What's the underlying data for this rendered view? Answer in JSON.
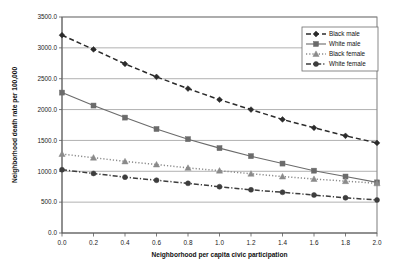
{
  "chart_data": {
    "type": "line",
    "title": "",
    "xlabel": "Neighborhood per capita civic participation",
    "ylabel": "Neighborhood death rate per 100,000",
    "x": [
      0.0,
      0.2,
      0.4,
      0.6,
      0.8,
      1.0,
      1.2,
      1.4,
      1.6,
      1.8,
      2.0
    ],
    "xlim": [
      0.0,
      2.0
    ],
    "ylim": [
      0.0,
      3500.0
    ],
    "xticks": [
      "0.0",
      "0.2",
      "0.4",
      "0.6",
      "0.8",
      "1.0",
      "1.2",
      "1.4",
      "1.6",
      "1.8",
      "2.0"
    ],
    "yticks": [
      "0.0",
      "500.0",
      "1000.0",
      "1500.0",
      "2000.0",
      "2500.0",
      "3000.0",
      "3500.0"
    ],
    "grid": "horizontal",
    "legend_position": "top-right",
    "series": [
      {
        "name": "Black male",
        "marker": "diamond",
        "line_style": "dashed",
        "color": "#2b2b2b",
        "values": [
          3205,
          2975,
          2740,
          2530,
          2340,
          2160,
          2000,
          1840,
          1705,
          1575,
          1460
        ]
      },
      {
        "name": "White male",
        "marker": "square",
        "line_style": "solid",
        "color": "#6b6b6b",
        "values": [
          2275,
          2065,
          1870,
          1685,
          1520,
          1375,
          1245,
          1125,
          1010,
          915,
          820
        ]
      },
      {
        "name": "Black female",
        "marker": "triangle",
        "line_style": "dotted",
        "color": "#8a8a8a",
        "values": [
          1280,
          1220,
          1160,
          1110,
          1055,
          1010,
          960,
          915,
          875,
          840,
          805
        ]
      },
      {
        "name": "White female",
        "marker": "circle",
        "line_style": "dashdot",
        "color": "#3d3d3d",
        "values": [
          1025,
          965,
          905,
          855,
          805,
          750,
          700,
          660,
          615,
          570,
          535
        ]
      }
    ]
  },
  "legend": {
    "items": [
      {
        "label": "Black male"
      },
      {
        "label": "White male"
      },
      {
        "label": "Black female"
      },
      {
        "label": "White female"
      }
    ]
  }
}
